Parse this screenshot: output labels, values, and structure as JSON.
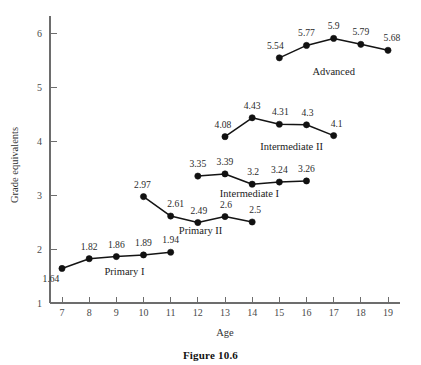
{
  "figure": {
    "caption": "Figure 10.6"
  },
  "chart_data": {
    "type": "line",
    "title": "",
    "xlabel": "Age",
    "ylabel": "Grade equivalents",
    "xlim": [
      6.6,
      19.6
    ],
    "ylim": [
      1,
      6.35
    ],
    "xticks": [
      7,
      8,
      9,
      10,
      11,
      12,
      13,
      14,
      15,
      16,
      17,
      18,
      19
    ],
    "yticks": [
      1,
      2,
      3,
      4,
      5,
      6
    ],
    "xtick_labels": [
      "7",
      "8",
      "9",
      "10",
      "11",
      "12",
      "13",
      "14",
      "15",
      "16",
      "17",
      "18",
      "19"
    ],
    "ytick_labels": [
      "1",
      "2",
      "3",
      "4",
      "5",
      "6"
    ],
    "grid": false,
    "legend": "inline-labels",
    "series": [
      {
        "name": "Primary I",
        "label_x": 9.3,
        "label_y": 1.52,
        "x": [
          7,
          8,
          9,
          10,
          11
        ],
        "values": [
          1.64,
          1.82,
          1.86,
          1.89,
          1.94
        ],
        "point_labels": [
          "1.64",
          "1.82",
          "1.86",
          "1.89",
          "1.94"
        ],
        "label_offsets": [
          {
            "dx": -11,
            "dy": 14
          },
          {
            "dx": 0,
            "dy": -9
          },
          {
            "dx": 0,
            "dy": -9
          },
          {
            "dx": 0,
            "dy": -9
          },
          {
            "dx": 0,
            "dy": -9
          }
        ]
      },
      {
        "name": "Primary II",
        "label_x": 12.1,
        "label_y": 2.27,
        "x": [
          10,
          11,
          12,
          13,
          14
        ],
        "values": [
          2.97,
          2.61,
          2.49,
          2.6,
          2.5
        ],
        "point_labels": [
          "2.97",
          "2.61",
          "2.49",
          "2.6",
          "2.5"
        ],
        "label_offsets": [
          {
            "dx": -1,
            "dy": -9
          },
          {
            "dx": 5,
            "dy": -9
          },
          {
            "dx": 1,
            "dy": -9
          },
          {
            "dx": 1,
            "dy": -9
          },
          {
            "dx": 3,
            "dy": -9
          }
        ]
      },
      {
        "name": "Intermediate I",
        "label_x": 13.9,
        "label_y": 2.97,
        "x": [
          12,
          13,
          14,
          15,
          16
        ],
        "values": [
          3.35,
          3.39,
          3.2,
          3.24,
          3.26
        ],
        "point_labels": [
          "3.35",
          "3.39",
          "3.2",
          "3.24",
          "3.26"
        ],
        "label_offsets": [
          {
            "dx": 0,
            "dy": -9
          },
          {
            "dx": 0,
            "dy": -9
          },
          {
            "dx": 1,
            "dy": -9
          },
          {
            "dx": 0,
            "dy": -9
          },
          {
            "dx": 0,
            "dy": -9
          }
        ]
      },
      {
        "name": "Intermediate II",
        "label_x": 15.45,
        "label_y": 3.83,
        "x": [
          13,
          14,
          15,
          16,
          17
        ],
        "values": [
          4.08,
          4.43,
          4.31,
          4.3,
          4.1
        ],
        "point_labels": [
          "4.08",
          "4.43",
          "4.31",
          "4.3",
          "4.1"
        ],
        "label_offsets": [
          {
            "dx": -2,
            "dy": -9
          },
          {
            "dx": 0,
            "dy": -9
          },
          {
            "dx": 1,
            "dy": -9
          },
          {
            "dx": 1,
            "dy": -9
          },
          {
            "dx": 3,
            "dy": -9
          }
        ]
      },
      {
        "name": "Advanced",
        "label_x": 17.0,
        "label_y": 5.23,
        "x": [
          15,
          16,
          17,
          18,
          19
        ],
        "values": [
          5.54,
          5.77,
          5.9,
          5.79,
          5.68
        ],
        "point_labels": [
          "5.54",
          "5.77",
          "5.9",
          "5.79",
          "5.68"
        ],
        "label_offsets": [
          {
            "dx": -4,
            "dy": -9
          },
          {
            "dx": 0,
            "dy": -9
          },
          {
            "dx": 0,
            "dy": -9
          },
          {
            "dx": 0,
            "dy": -9
          },
          {
            "dx": 4,
            "dy": -9
          }
        ]
      }
    ]
  },
  "colors": {
    "line": "#141414",
    "point": "#111111",
    "axis": "#6d6d6d",
    "text": "#2b2b2b",
    "background": "#ffffff"
  }
}
